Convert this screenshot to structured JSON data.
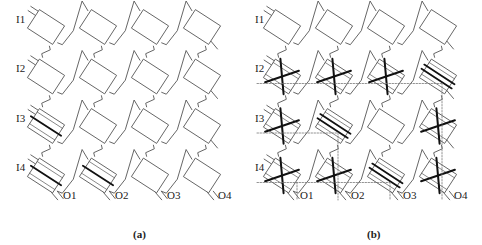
{
  "figure": {
    "panels": [
      {
        "id": "a",
        "caption": "(a)",
        "input_labels": [
          "I1",
          "I2",
          "I3",
          "I4"
        ],
        "output_labels": [
          "O1",
          "O2",
          "O3",
          "O4"
        ],
        "switch_states": [
          [
            "plain",
            "plain",
            "plain",
            "plain"
          ],
          [
            "plain",
            "plain",
            "plain",
            "plain"
          ],
          [
            "bar1",
            "plain",
            "plain",
            "plain"
          ],
          [
            "bar1",
            "bar1",
            "plain",
            "plain"
          ]
        ],
        "show_paths": false
      },
      {
        "id": "b",
        "caption": "(b)",
        "input_labels": [
          "I1",
          "I2",
          "I3",
          "I4"
        ],
        "output_labels": [
          "O1",
          "O2",
          "O3",
          "O4"
        ],
        "switch_states": [
          [
            "plain",
            "plain",
            "plain",
            "plain"
          ],
          [
            "cross",
            "cross",
            "cross",
            "bar2"
          ],
          [
            "cross",
            "bar2",
            "plain",
            "cross"
          ],
          [
            "cross",
            "cross",
            "bar2",
            "cross"
          ]
        ],
        "show_paths": true
      }
    ],
    "legend": {
      "plain": "idle switch",
      "cross": "cross state (X)",
      "bar1": "bar state (single line)",
      "bar2": "bar state (double line)"
    },
    "colors": {
      "line": "#555555",
      "state": "#111111",
      "path": "#777777",
      "text": "#222222"
    }
  }
}
